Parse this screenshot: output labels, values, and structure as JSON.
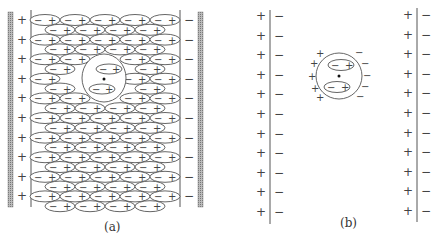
{
  "figure": {
    "panels": [
      {
        "id": "a",
        "caption": "(a)",
        "description": "Parallel-plate capacitor filled with polarized dielectric molecules (dipoles), with a spherical cavity containing two dipoles and a central point",
        "plate_left_sign": "+",
        "plate_right_sign": "−",
        "dipole_neg": "−",
        "dipole_pos": "+",
        "charge_rows": 10
      },
      {
        "id": "b",
        "caption": "(b)",
        "description": "Same plates without surrounding dielectric; the cavity sphere with its induced surface charges shown alone",
        "plate_left_sign": "+",
        "plate_right_sign": "−",
        "sphere_left_signs": [
          "+",
          "+",
          "+",
          "+",
          "+"
        ],
        "sphere_right_signs": [
          "−",
          "−",
          "−",
          "−",
          "−"
        ],
        "charge_rows": 11
      }
    ]
  }
}
